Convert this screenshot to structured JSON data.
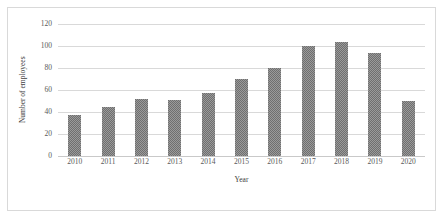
{
  "chart_data": {
    "type": "bar",
    "title": "",
    "xlabel": "Year",
    "ylabel": "Number of employees",
    "categories": [
      "2010",
      "2011",
      "2012",
      "2013",
      "2014",
      "2015",
      "2016",
      "2017",
      "2018",
      "2019",
      "2020"
    ],
    "values": [
      37,
      45,
      52,
      51,
      57,
      70,
      80,
      100,
      104,
      94,
      50
    ],
    "series": [
      {
        "name": "Number of employees",
        "values": [
          37,
          45,
          52,
          51,
          57,
          70,
          80,
          100,
          104,
          94,
          50
        ]
      }
    ],
    "ylim": [
      0,
      120
    ],
    "yticks": [
      0,
      20,
      40,
      60,
      80,
      100,
      120
    ],
    "ytick_labels": [
      "0",
      "20",
      "40",
      "60",
      "80",
      "100",
      "120"
    ],
    "grid": "horizontal",
    "legend": "none",
    "bar_color": "#6f6f6f",
    "bar_pattern": "checkered",
    "gridline_color": "#d9d9d9",
    "frame_color": "#d9d9d9",
    "background": "#ffffff"
  }
}
